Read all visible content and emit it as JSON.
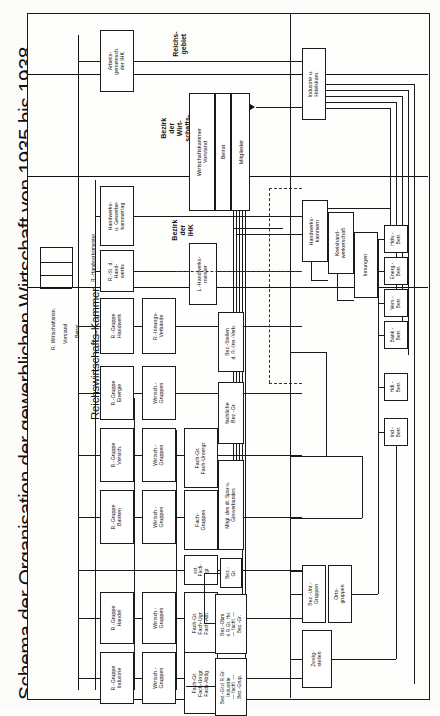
{
  "document": {
    "title": "Schema der Organisation der gewerblichen Wirtschaft von 1935 bis 1938",
    "language": "de",
    "type": "organizational-chart"
  },
  "zones": [
    {
      "id": "reichsgebiet",
      "label_lines": [
        "Reichs-",
        "gebiet"
      ]
    },
    {
      "id": "bezirk-wirtschaftskammern",
      "label_lines": [
        "Bezirk",
        "der",
        "Wirt-",
        "schafts-",
        "kammern"
      ]
    },
    {
      "id": "bezirk-ihk",
      "label_lines": [
        "Bezirk",
        "der",
        "IHK"
      ]
    }
  ],
  "spine": {
    "ministry": "R. Wirtschaftsmin.",
    "vorstand": "Vorstand",
    "beirat": "Beirat",
    "chamber": "Reichswirtschafts-Kammer",
    "handwerksmeister": "R.-Handwerksmeister"
  },
  "boxes": {
    "arbeitsgemeinschaft": [
      "Arbeits-",
      "gemeinsch.",
      "der IHK"
    ],
    "handwerkskammertag": [
      "Handwerks-",
      "u. Gewerbe-",
      "kammertag"
    ],
    "reichsstand_handwerk": [
      "R.-St. d.",
      "Hand-",
      "werks"
    ],
    "rgruppe_handwerk": [
      "R.-Gruppe",
      "Handwerk"
    ],
    "rinnungsverbaende": [
      "R.-Innungs-",
      "Verbände"
    ],
    "rgruppe_energie": [
      "R.-Gruppe",
      "Energie"
    ],
    "rgruppe_versich": [
      "R.-Gruppe",
      "Versich."
    ],
    "rgruppe_banken": [
      "R.-Gruppe",
      "Banken"
    ],
    "rgruppe_handel": [
      "R.-Gruppe",
      "Handel"
    ],
    "rgruppe_industrie": [
      "R.-Gruppe",
      "Industrie"
    ],
    "wirtschaftsgruppen_energie": [
      "Wirtsch.-",
      "Gruppen"
    ],
    "wirtschaftsgruppen_versich": [
      "Wirtsch.-",
      "Gruppen"
    ],
    "wirtschaftsgruppen_banken": [
      "Wirtsch.-",
      "Gruppen"
    ],
    "wirtschaftsgruppen_handel": [
      "Wirtsch.-",
      "Gruppen"
    ],
    "wirtschaftsgruppen_industrie": [
      "Wirtsch.-",
      "Gruppen"
    ],
    "fachgr_versich": [
      "Fach-Gr.",
      "Fach-Untergr."
    ],
    "fachgruppen_banken": [
      "Fach-",
      "Gruppen"
    ],
    "sst_fachgr": [
      "sst.",
      "Fach-",
      "gr."
    ],
    "fachgr_handel": [
      "Fach-Gr.",
      "Fach-Ugr.",
      "Fach-Abt."
    ],
    "fachgr_industrie": [
      "Fach-Gr.",
      "Fach-Untgr.",
      "Fach-Abtlg."
    ],
    "wirtschaftskammer": [
      "Wirtschaftskammer",
      "Vorstand"
    ],
    "wk_beirat": [
      "Beirat"
    ],
    "wk_mitglieder": [
      "Mitglieder"
    ],
    "l_handwerksmeister": [
      "L.-Handwerks-",
      "meister"
    ],
    "bez_stellen_innung": [
      "Bez.-Stellen",
      "d. R.-Inn.-Verb."
    ],
    "fachliche_bez_gr": [
      "fachliche",
      "Bez.-Gr."
    ],
    "mitgl_spar_giro": [
      "Mitgl. des dt. Spar-u.",
      "Giroverbandes"
    ],
    "bez_gr": [
      "Bez.-",
      "Gr."
    ],
    "bez_obm_handel": [
      "Bez.-Obm.",
      "d.R.Gr. Hd.",
      "— fachl. —",
      "Bez.-Gr."
    ],
    "bez_gr_industrie": [
      "Bez.-Gr.d R.Gr.",
      "Industrie",
      "— fachl. —",
      "Bez.-Grup."
    ],
    "industrie_handelskammer": [
      "Industrie u.",
      "Hdelskam."
    ],
    "handwerkskammern": [
      "Handwerks-",
      "kammern"
    ],
    "kreishandwerkerschaft": [
      "Kreishand-",
      "werkerschaft"
    ],
    "innungen": [
      "Innungen"
    ],
    "hdw_betr": [
      "Hdw.-",
      "Betr."
    ],
    "energ_betr": [
      "Energ.-",
      "Betr."
    ],
    "vers_betr": [
      "Vers.-",
      "Betr."
    ],
    "bank_betr": [
      "Bank.-",
      "Betr."
    ],
    "hdl_betr": [
      "Hdl.-",
      "Betr."
    ],
    "ind_betr": [
      "Ind.-",
      "Betr."
    ],
    "bez_unt_gruppen": [
      "Bez.-Unt.-",
      "Gruppen"
    ],
    "ortsgruppen": [
      "Orts-",
      "gruppen"
    ],
    "zweigstellen": [
      "Zweig-",
      "stellen"
    ]
  },
  "colors": {
    "ink": "#1a1a1a",
    "paper": "#fdfdfb",
    "background": "#fbfbf9"
  }
}
